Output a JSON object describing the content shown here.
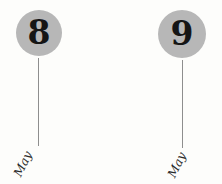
{
  "timeline": {
    "events": [
      {
        "day": "8",
        "month": "May"
      },
      {
        "day": "9",
        "month": "May"
      }
    ],
    "colors": {
      "circle_fill": "#b7b7b7",
      "day_number": "#151515",
      "stem_line": "#8e8e8e",
      "month_label": "#2a2a2a",
      "background": "#fdfdfb"
    }
  }
}
